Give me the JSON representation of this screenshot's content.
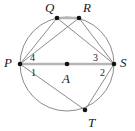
{
  "figure": {
    "type": "circle-inscribed-polygon",
    "canvas": {
      "width": 135,
      "height": 131
    },
    "colors": {
      "stroke": "#8c8c8c",
      "highlight": "#b5b5b5",
      "point": "#111111",
      "text": "#1a1a1a",
      "background": "#ffffff"
    },
    "circle": {
      "name": "circle-A",
      "center": {
        "x": 67,
        "y": 64
      },
      "radius": 47
    },
    "points": [
      {
        "id": "P",
        "label": "P",
        "x": 20,
        "y": 64,
        "label_x": 4,
        "label_y": 56
      },
      {
        "id": "Q",
        "label": "Q",
        "x": 57,
        "y": 18,
        "label_x": 45,
        "label_y": 1
      },
      {
        "id": "R",
        "label": "R",
        "x": 79,
        "y": 18,
        "label_x": 83,
        "label_y": 1
      },
      {
        "id": "S",
        "label": "S",
        "x": 114,
        "y": 64,
        "label_x": 120,
        "label_y": 56
      },
      {
        "id": "T",
        "label": "T",
        "x": 85,
        "y": 110,
        "label_x": 88,
        "label_y": 116
      },
      {
        "id": "A",
        "label": "A",
        "x": 67,
        "y": 64,
        "label_x": 62,
        "label_y": 72
      }
    ],
    "chords": [
      {
        "id": "PS",
        "from": "P",
        "to": "S",
        "style": "highlight",
        "note": "diameter through center A"
      },
      {
        "id": "QR",
        "from": "Q",
        "to": "R",
        "style": "highlight"
      },
      {
        "id": "PQ",
        "from": "P",
        "to": "Q",
        "style": "normal"
      },
      {
        "id": "PR",
        "from": "P",
        "to": "R",
        "style": "normal"
      },
      {
        "id": "PT",
        "from": "P",
        "to": "T",
        "style": "normal"
      },
      {
        "id": "QS",
        "from": "Q",
        "to": "S",
        "style": "normal"
      },
      {
        "id": "RS",
        "from": "R",
        "to": "S",
        "style": "normal"
      },
      {
        "id": "TS",
        "from": "T",
        "to": "S",
        "style": "normal"
      }
    ],
    "angles": [
      {
        "id": "angle-4",
        "label": "4",
        "at": "P",
        "position": "above",
        "label_x": 30,
        "label_y": 53
      },
      {
        "id": "angle-1",
        "label": "1",
        "at": "P",
        "position": "below",
        "label_x": 31,
        "label_y": 68
      },
      {
        "id": "angle-3",
        "label": "3",
        "at": "S",
        "position": "above",
        "label_x": 93,
        "label_y": 53
      },
      {
        "id": "angle-2",
        "label": "2",
        "at": "S",
        "position": "below",
        "label_x": 100,
        "label_y": 68
      }
    ]
  }
}
